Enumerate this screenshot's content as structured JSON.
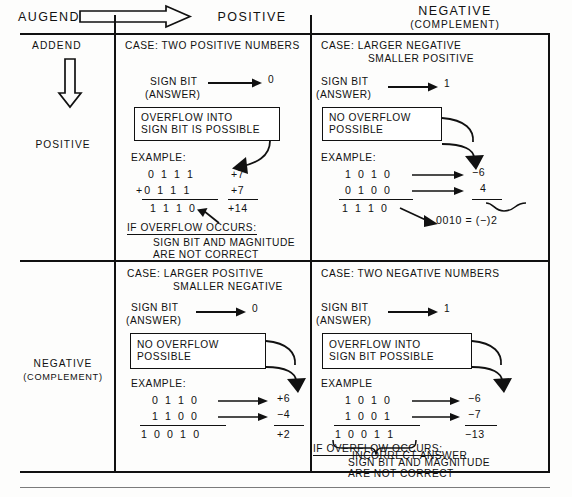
{
  "header": {
    "augend_label": "AUGEND",
    "addend_label": "ADDEND",
    "col_positive": "POSITIVE",
    "col_negative": "NEGATIVE",
    "col_negative_sub": "(COMPLEMENT)",
    "row_positive": "POSITIVE",
    "row_negative": "NEGATIVE",
    "row_negative_sub": "(COMPLEMENT)",
    "augend_arrow_icon": "block-arrow-right-icon",
    "addend_arrow_icon": "block-arrow-down-icon"
  },
  "quadrants": {
    "pos_pos": {
      "case_line1": "CASE: TWO POSITIVE NUMBERS",
      "case_line2": "",
      "sign_bit_label": "SIGN BIT",
      "sign_bit_sub": "(ANSWER)",
      "sign_bit_value": "0",
      "callout_line1": "OVERFLOW INTO",
      "callout_line2": "SIGN BIT IS POSSIBLE",
      "example_label": "EXAMPLE:",
      "operand1_bin": "0 1 1 1",
      "operand1_dec": "+7",
      "operand2_bin": "+0 1 1 1",
      "operand2_dec": "+7",
      "sum_bin": "1 1 1 0",
      "sum_dec": "+14",
      "footer_line1": "IF OVERFLOW OCCURS:",
      "footer_line2": "SIGN BIT AND MAGNITUDE",
      "footer_line3": "ARE NOT CORRECT"
    },
    "pos_neg": {
      "case_line1": "CASE: LARGER NEGATIVE",
      "case_line2": "SMALLER POSITIVE",
      "sign_bit_label": "SIGN BIT",
      "sign_bit_sub": "(ANSWER)",
      "sign_bit_value": "1",
      "callout_line1": "NO OVERFLOW",
      "callout_line2": "POSSIBLE",
      "example_label": "EXAMPLE:",
      "operand1_bin": "1 0 1 0",
      "operand1_dec": "−6",
      "operand2_bin": "0 1 0 0",
      "operand2_dec": "4",
      "sum_bin": "1 1 1 0",
      "sum_note": "0010 = (−)2"
    },
    "neg_pos": {
      "case_line1": "CASE: LARGER POSITIVE",
      "case_line2": "SMALLER NEGATIVE",
      "sign_bit_label": "SIGN BIT",
      "sign_bit_sub": "(ANSWER)",
      "sign_bit_value": "0",
      "callout_line1": "NO OVERFLOW",
      "callout_line2": "POSSIBLE",
      "example_label": "EXAMPLE:",
      "operand1_bin": "0 1 1 0",
      "operand1_dec": "+6",
      "operand2_bin": "1 1 0 0",
      "operand2_dec": "−4",
      "sum_bin": "1 0 0 1 0",
      "sum_dec": "+2"
    },
    "neg_neg": {
      "case_line1": "CASE: TWO NEGATIVE NUMBERS",
      "case_line2": "",
      "sign_bit_label": "SIGN BIT",
      "sign_bit_sub": "(ANSWER)",
      "sign_bit_value": "1",
      "callout_line1": "OVERFLOW INTO",
      "callout_line2": "SIGN BIT POSSIBLE",
      "example_label": "EXAMPLE",
      "operand1_bin": "1 0 1 0",
      "operand1_dec": "−6",
      "operand2_bin": "1 0 0 1",
      "operand2_dec": "−7",
      "sum_bin": "1 0 0 1 1",
      "sum_dec": "−13",
      "brace_note": "INCORRECT ANSWER",
      "footer_line1": "IF OVERFLOW OCCURS:",
      "footer_line2": "SIGN BIT AND MAGNITUDE",
      "footer_line3": "ARE NOT CORRECT"
    }
  },
  "colors": {
    "ink": "#111111",
    "paper": "#fdfdfc"
  }
}
